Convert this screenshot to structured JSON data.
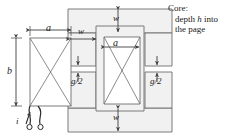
{
  "figure": {
    "type": "magnetic-core-diagram",
    "title": ""
  },
  "annotation": {
    "line1": "Core:",
    "line2_pre": "depth ",
    "line2_var": "h",
    "line2_post": " into",
    "line3": "the page"
  },
  "dimensions": {
    "a_top": "a",
    "a_center": "a",
    "b_left": "b",
    "w_top": "w",
    "w_mid": "w",
    "w_bottom": "w",
    "gap_left": "g/2",
    "gap_right": "g/2",
    "current": "i"
  },
  "colors": {
    "core_fill": "#f2f2f2",
    "line": "#3f3f3f",
    "text": "#1a1a1a",
    "background": "#ffffff"
  },
  "geometry": {
    "outer_core": {
      "x": 68,
      "y": 9,
      "w": 104,
      "h": 123
    },
    "window_left": {
      "x": 68,
      "y": 33,
      "w": 28,
      "h": 33
    },
    "window_right": {
      "x": 145,
      "y": 33,
      "w": 27,
      "h": 33
    },
    "center_limb": {
      "x": 96,
      "y": 26,
      "w": 48,
      "h": 85
    },
    "left_coil": {
      "x": 30,
      "y": 38,
      "w": 41,
      "h": 68
    },
    "center_coil": {
      "x": 104,
      "y": 37,
      "w": 36,
      "h": 67
    }
  }
}
